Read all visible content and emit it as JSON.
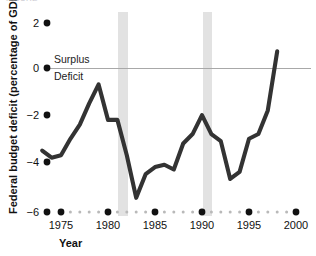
{
  "figure": {
    "clipped_caption": "FIGURE",
    "background_color": "#ffffff",
    "line_color": "#333333",
    "band_color": "#e2e2e2",
    "zero_line_color": "#a8a8a8"
  },
  "chart_data": {
    "type": "line",
    "title": "",
    "xlabel": "Year",
    "ylabel": "Federal budget deficit (percentage of GDP)",
    "xlim": [
      1973,
      2000
    ],
    "ylim": [
      -6,
      2
    ],
    "xticks": [
      1975,
      1980,
      1985,
      1990,
      1995,
      2000
    ],
    "xticklabels": [
      "1975",
      "1980",
      "1985",
      "1990",
      "1995",
      "2000"
    ],
    "yticks": [
      2,
      0,
      -2,
      -4,
      -6
    ],
    "yticklabels": [
      "2",
      "0",
      "−2",
      "−4",
      "−6"
    ],
    "grid": false,
    "legend": "none",
    "zero_reference_line": 0,
    "annotations": [
      {
        "text": "Surplus",
        "x": 1974.4,
        "y": 0.45
      },
      {
        "text": "Deficit",
        "x": 1974.4,
        "y": -0.55
      }
    ],
    "shaded_regions": [
      {
        "label": "recession",
        "x_start": 1980.9,
        "x_end": 1982.0
      },
      {
        "label": "recession",
        "x_start": 1990.0,
        "x_end": 1991.0
      }
    ],
    "series": [
      {
        "name": "Federal budget deficit (percentage of GDP)",
        "x": [
          1973,
          1974,
          1975,
          1976,
          1977,
          1978,
          1979,
          1980,
          1981,
          1982,
          1983,
          1984,
          1985,
          1986,
          1987,
          1988,
          1989,
          1990,
          1991,
          1992,
          1993,
          1994,
          1995,
          1996,
          1997,
          1998
        ],
        "values": [
          -3.4,
          -3.7,
          -3.6,
          -2.9,
          -2.3,
          -1.4,
          -0.6,
          -2.1,
          -2.1,
          -3.6,
          -5.4,
          -4.4,
          -4.1,
          -4.0,
          -4.2,
          -3.1,
          -2.7,
          -1.9,
          -2.7,
          -3.0,
          -4.6,
          -4.3,
          -2.9,
          -2.7,
          -1.7,
          0.8
        ]
      }
    ]
  }
}
